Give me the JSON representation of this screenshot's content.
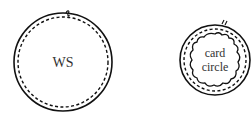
{
  "diagram": {
    "left": {
      "label": "WS"
    },
    "right": {
      "label_line1": "card",
      "label_line2": "circle"
    },
    "colors": {
      "stroke": "#111111",
      "text": "#333333",
      "background": "#ffffff"
    }
  }
}
